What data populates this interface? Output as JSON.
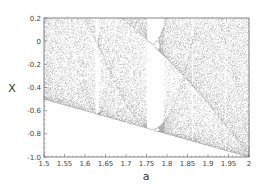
{
  "chart_data": {
    "type": "scatter",
    "title": "",
    "xlabel": "a",
    "ylabel": "X",
    "xlim": [
      1.5,
      2.0
    ],
    "ylim": [
      -1.0,
      0.2
    ],
    "xticks": [
      1.5,
      1.55,
      1.6,
      1.65,
      1.7,
      1.75,
      1.8,
      1.85,
      1.9,
      1.95,
      2.0
    ],
    "xtick_labels": [
      "1.5",
      "1.55",
      "1.6",
      "1.65",
      "1.7",
      "1.75",
      "1.8",
      "1.85",
      "1.9",
      "1.95",
      "2"
    ],
    "yticks": [
      0.2,
      0.0,
      -0.2,
      -0.4,
      -0.6,
      -0.8,
      -1.0
    ],
    "ytick_labels": [
      "0.2",
      "0",
      "-0.2",
      "-0.4",
      "-0.6",
      "-0.8",
      "-1.0"
    ],
    "grid": false,
    "legend": null,
    "series": [
      {
        "name": "attractor",
        "map": "x' = 1 - a*x^2",
        "lower_bound": {
          "a": [
            1.5,
            2.0
          ],
          "x": [
            -0.5,
            -1.0
          ]
        },
        "periodic_window": {
          "a_start": 1.75,
          "a_end": 1.79
        },
        "point_color": "#555555"
      }
    ]
  },
  "render": {
    "plot_left": 44,
    "plot_right": 249,
    "plot_top": 18,
    "plot_bottom": 157,
    "a_steps": 410,
    "iterations_per_a": 140,
    "transient": 200,
    "point_opacity": 0.55
  }
}
